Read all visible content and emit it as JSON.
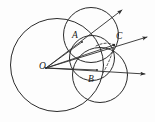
{
  "figure": {
    "background_color": "#fdfdfd",
    "stroke_color": "#2b2b2b",
    "label_color": "#1a1a1a",
    "labels": [
      {
        "text": "O",
        "x": 39,
        "y": 62,
        "name": "point-label-o"
      },
      {
        "text": "A",
        "x": 72,
        "y": 31,
        "name": "point-label-a"
      },
      {
        "text": "B",
        "x": 88,
        "y": 75,
        "name": "point-label-b"
      },
      {
        "text": "C",
        "x": 116,
        "y": 32,
        "name": "point-label-c"
      }
    ],
    "circles": [
      {
        "name": "large-circle-o",
        "cx": 57,
        "cy": 65,
        "r": 46.5,
        "stroke_width": 1.0,
        "dashed": false
      },
      {
        "name": "upper-circle",
        "cx": 91,
        "cy": 35,
        "r": 27.5,
        "stroke_width": 1.0,
        "dashed": false
      },
      {
        "name": "lower-circle",
        "cx": 100,
        "cy": 75,
        "r": 27.5,
        "stroke_width": 1.0,
        "dashed": false
      },
      {
        "name": "middle-circle",
        "cx": 92,
        "cy": 58,
        "r": 22.5,
        "stroke_width": 1.0,
        "dashed": false
      }
    ],
    "rays": [
      {
        "name": "ray-upper",
        "x1": 46,
        "y1": 68,
        "x2": 124,
        "y2": 9
      },
      {
        "name": "ray-middle",
        "x1": 46,
        "y1": 68,
        "x2": 149,
        "y2": 36
      },
      {
        "name": "ray-lower",
        "x1": 46,
        "y1": 68,
        "x2": 147,
        "y2": 74
      }
    ],
    "chords": [
      {
        "name": "chord-o-to-a",
        "x1": 46,
        "y1": 68,
        "x2": 80,
        "y2": 40
      },
      {
        "name": "chord-o-to-b",
        "x1": 46,
        "y1": 68,
        "x2": 96,
        "y2": 72
      }
    ],
    "dashed_arcs": [
      {
        "name": "dashed-arc-upper",
        "d": "M 96 46 Q 106 42 113 45",
        "stroke_width": 0.9
      },
      {
        "name": "dashed-arc-lower",
        "d": "M 104 72 Q 110 62 113 50",
        "stroke_width": 0.9
      }
    ],
    "points": [
      {
        "name": "point-a",
        "x": 82,
        "y": 42
      },
      {
        "name": "point-b",
        "x": 97,
        "y": 70
      },
      {
        "name": "point-c",
        "x": 114,
        "y": 45
      }
    ]
  }
}
